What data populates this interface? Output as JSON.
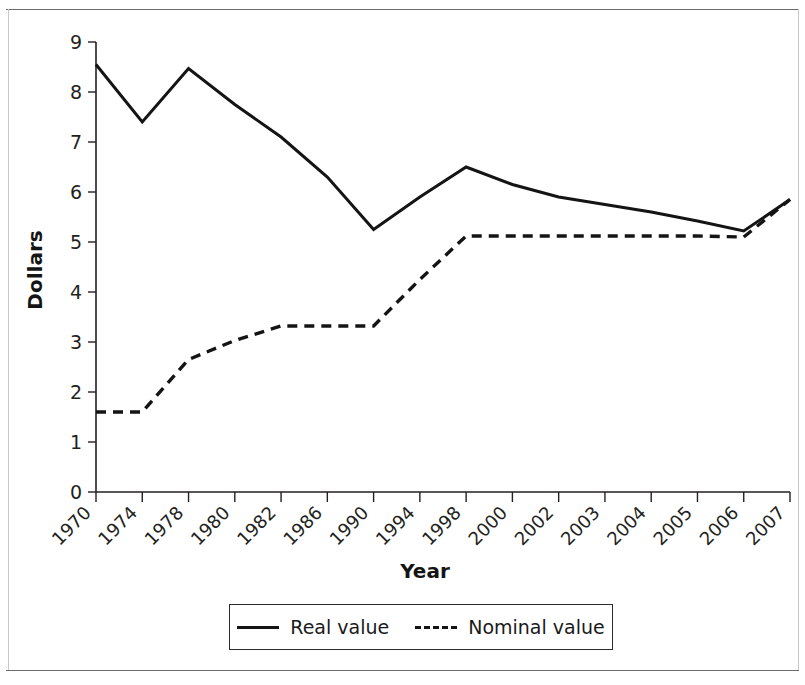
{
  "chart_data": {
    "type": "line",
    "title": "",
    "xlabel": "Year",
    "ylabel": "Dollars",
    "categories": [
      "1970",
      "1974",
      "1978",
      "1980",
      "1982",
      "1986",
      "1990",
      "1994",
      "1998",
      "2000",
      "2002",
      "2003",
      "2004",
      "2005",
      "2006",
      "2007"
    ],
    "series": [
      {
        "name": "Real value",
        "style": "solid",
        "values": [
          8.55,
          7.4,
          8.47,
          7.75,
          7.1,
          6.3,
          5.25,
          5.9,
          6.5,
          6.15,
          5.9,
          5.75,
          5.6,
          5.42,
          5.22,
          5.85
        ]
      },
      {
        "name": "Nominal value",
        "style": "dashed",
        "values": [
          1.6,
          1.6,
          2.65,
          3.03,
          3.32,
          3.32,
          3.32,
          4.25,
          5.12,
          5.12,
          5.12,
          5.12,
          5.12,
          5.12,
          5.1,
          5.85
        ]
      }
    ],
    "ylim": [
      0,
      9
    ],
    "ytick_labels": [
      "0",
      "1",
      "2",
      "3",
      "4",
      "5",
      "6",
      "7",
      "8",
      "9"
    ],
    "ytick_values": [
      0,
      1,
      2,
      3,
      4,
      5,
      6,
      7,
      8,
      9
    ],
    "grid": false,
    "legend_position": "below-axis"
  },
  "legend": {
    "entries": [
      {
        "label": "Real value",
        "style": "solid"
      },
      {
        "label": "Nominal value",
        "style": "dashed"
      }
    ]
  },
  "axis_titles": {
    "x": "Year",
    "y": "Dollars"
  }
}
